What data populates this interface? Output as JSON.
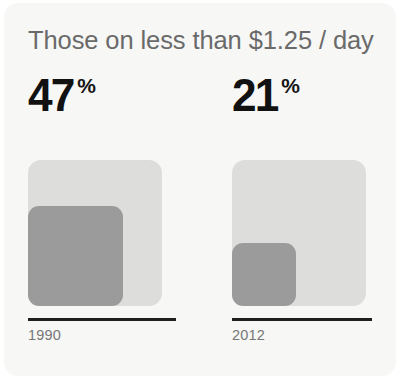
{
  "card": {
    "title": "Those on less than $1.25 / day",
    "background_color": "#f7f7f6",
    "title_color": "#6a6a6a"
  },
  "chart_data": {
    "type": "bar",
    "title": "Those on less than $1.25 / day",
    "xlabel": "",
    "ylabel": "",
    "unit": "%",
    "categories": [
      "1990",
      "2012"
    ],
    "values": [
      47,
      21
    ],
    "value_labels": [
      "47",
      "21"
    ],
    "percent_symbol": "%",
    "ylim": [
      0,
      100
    ],
    "grid": false,
    "legend": false,
    "style": "nested-squares-area-proportional",
    "colors": {
      "reference_square": "#dddddc",
      "value_square": "#9b9b9b",
      "value_text": "#111111",
      "rule": "#1f1f1f",
      "year_label": "#767676"
    },
    "series": [
      {
        "name": "Share of population on less than $1.25 / day",
        "points": [
          {
            "category": "1990",
            "value": 47,
            "label": "47",
            "unit": "%"
          },
          {
            "category": "2012",
            "value": 21,
            "label": "21",
            "unit": "%"
          }
        ]
      }
    ]
  }
}
